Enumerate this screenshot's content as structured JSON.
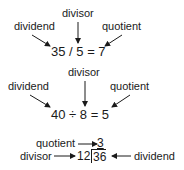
{
  "diagram": {
    "examples": [
      {
        "notation": "slash",
        "equation": "35 / 5 = 7",
        "labels": {
          "dividend": "dividend",
          "divisor": "divisor",
          "quotient": "quotient"
        }
      },
      {
        "notation": "obelus",
        "equation": "40 ÷ 8 = 5",
        "labels": {
          "dividend": "dividend",
          "divisor": "divisor",
          "quotient": "quotient"
        }
      },
      {
        "notation": "long-division",
        "divisor_value": "12",
        "dividend_value": "36",
        "quotient_value": "3",
        "labels": {
          "dividend": "dividend",
          "divisor": "divisor",
          "quotient": "quotient"
        }
      }
    ],
    "colors": {
      "text": "#1a1a1a",
      "background": "#ffffff"
    }
  }
}
